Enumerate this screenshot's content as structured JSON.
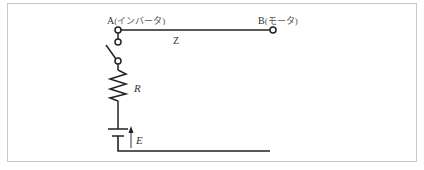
{
  "diagram": {
    "type": "circuit",
    "nodes": {
      "a": {
        "letter": "A",
        "description": "(インバータ)"
      },
      "b": {
        "letter": "B",
        "description": "(モータ)"
      }
    },
    "labels": {
      "impedance": "Z",
      "resistor": "R",
      "source": "E"
    },
    "components": [
      {
        "id": "switch",
        "kind": "switch",
        "state": "open"
      },
      {
        "id": "resistor",
        "kind": "resistor",
        "label": "R"
      },
      {
        "id": "battery",
        "kind": "dc-source",
        "label": "E"
      },
      {
        "id": "line-ab",
        "kind": "wire",
        "label": "Z"
      }
    ],
    "colors": {
      "wire": "#222222",
      "frame": "#c8c8c8",
      "text": "#333333"
    }
  }
}
